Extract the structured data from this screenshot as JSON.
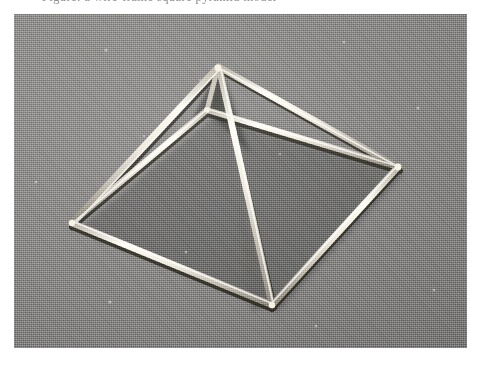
{
  "page": {
    "background_color": "#ffffff",
    "width": 480,
    "height": 365
  },
  "caption": {
    "text": "Figure: a wire-frame square pyramid model",
    "note": "clipped by the top edge of the screenshot; only letter descenders are visible"
  },
  "photo": {
    "kind": "halftone-printed-photograph",
    "subject": "wireframe square-based pyramid built from thin light-coloured rods / drinking straws",
    "background_color": "#888887",
    "rod_color": "#f2efe4",
    "rod_highlight_color": "#ffffff",
    "rod_shadow_color": "#2b2a28",
    "frame": {
      "x": 14,
      "y": 14,
      "width": 453,
      "height": 334
    },
    "rod_width_px": 6,
    "vertices": {
      "apex": {
        "label": "apex",
        "x": 204,
        "y": 53
      },
      "base_back": {
        "label": "base-back-corner",
        "x": 193,
        "y": 96
      },
      "base_left": {
        "label": "base-left-corner",
        "x": 58,
        "y": 209
      },
      "base_front": {
        "label": "base-front-corner",
        "x": 258,
        "y": 291
      },
      "base_right": {
        "label": "base-right-corner",
        "x": 384,
        "y": 153
      }
    },
    "edges": [
      {
        "name": "base-left-to-back",
        "from": "base_left",
        "to": "base_back",
        "occluded": false
      },
      {
        "name": "base-back-to-right",
        "from": "base_back",
        "to": "base_right",
        "occluded": false
      },
      {
        "name": "base-right-to-front",
        "from": "base_right",
        "to": "base_front",
        "occluded": false
      },
      {
        "name": "base-front-to-left",
        "from": "base_front",
        "to": "base_left",
        "occluded": false
      },
      {
        "name": "apex-to-left",
        "from": "apex",
        "to": "base_left",
        "occluded": false
      },
      {
        "name": "apex-to-back",
        "from": "apex",
        "to": "base_back",
        "occluded": true
      },
      {
        "name": "apex-to-right",
        "from": "apex",
        "to": "base_right",
        "occluded": false
      },
      {
        "name": "apex-to-front",
        "from": "apex",
        "to": "base_front",
        "occluded": false
      }
    ],
    "speckles": [
      {
        "x": 92,
        "y": 36,
        "r": 1.6
      },
      {
        "x": 330,
        "y": 28,
        "r": 1.2
      },
      {
        "x": 404,
        "y": 94,
        "r": 1.5
      },
      {
        "x": 130,
        "y": 122,
        "r": 1.1
      },
      {
        "x": 22,
        "y": 168,
        "r": 1.3
      },
      {
        "x": 236,
        "y": 196,
        "r": 1.4
      },
      {
        "x": 172,
        "y": 238,
        "r": 1.2
      },
      {
        "x": 96,
        "y": 288,
        "r": 1.5
      },
      {
        "x": 302,
        "y": 312,
        "r": 1.2
      },
      {
        "x": 420,
        "y": 276,
        "r": 1.3
      },
      {
        "x": 186,
        "y": 66,
        "r": 1.0
      },
      {
        "x": 266,
        "y": 140,
        "r": 1.0
      }
    ]
  }
}
